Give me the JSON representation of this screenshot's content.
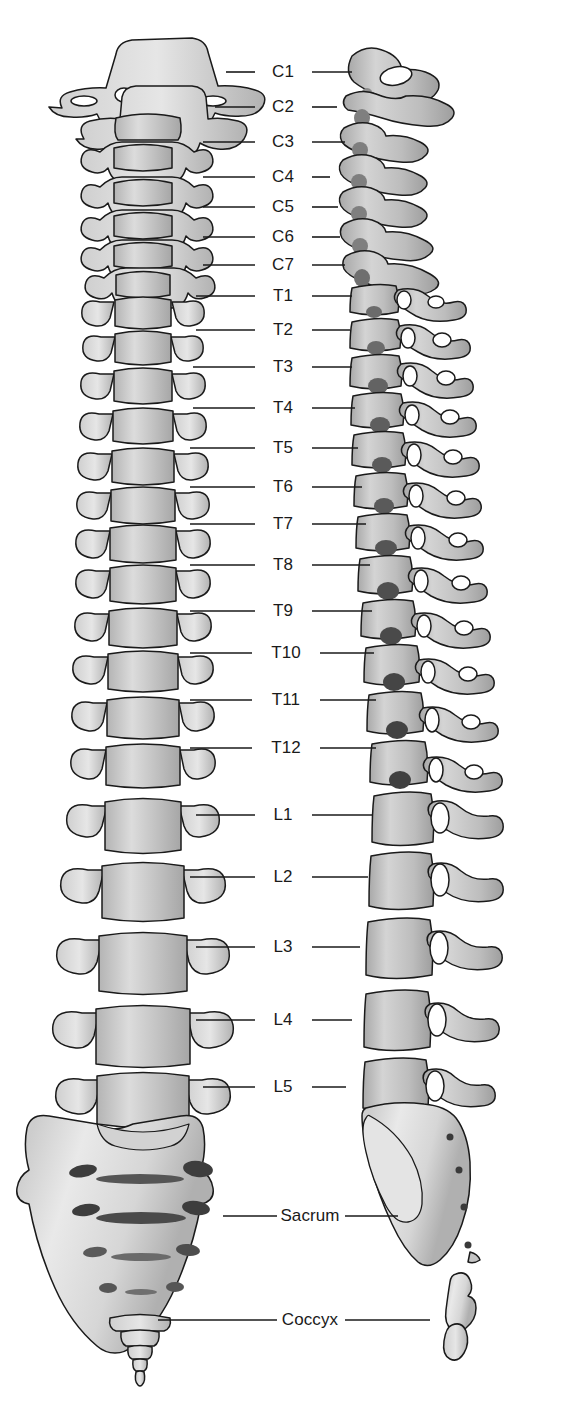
{
  "figure": {
    "views": [
      {
        "name": "anterior-view",
        "label": "Anterior view",
        "side": "left"
      },
      {
        "name": "lateral-view",
        "label": "Lateral view",
        "side": "right"
      }
    ],
    "colors": {
      "bone_light": "#e8e8e8",
      "bone_mid": "#c9c9c9",
      "bone_dark": "#a8a8a8",
      "outline": "#1a1a1a",
      "label_text": "#1a1a1a",
      "leader_line": "#1a1a1a",
      "background": "#ffffff"
    },
    "labels": [
      {
        "id": "C1",
        "text": "C1",
        "region": "cervical",
        "y": 72,
        "cx": 283,
        "left_line": [
          226,
          255
        ],
        "right_line": [
          312,
          352
        ]
      },
      {
        "id": "C2",
        "text": "C2",
        "region": "cervical",
        "y": 107,
        "cx": 283,
        "left_line": [
          215,
          255
        ],
        "right_line": [
          312,
          337
        ]
      },
      {
        "id": "C3",
        "text": "C3",
        "region": "cervical",
        "y": 142,
        "cx": 283,
        "left_line": [
          203,
          255
        ],
        "right_line": [
          312,
          345
        ]
      },
      {
        "id": "C4",
        "text": "C4",
        "region": "cervical",
        "y": 177,
        "cx": 283,
        "left_line": [
          203,
          255
        ],
        "right_line": [
          312,
          330
        ]
      },
      {
        "id": "C5",
        "text": "C5",
        "region": "cervical",
        "y": 207,
        "cx": 283,
        "left_line": [
          203,
          255
        ],
        "right_line": [
          312,
          338
        ]
      },
      {
        "id": "C6",
        "text": "C6",
        "region": "cervical",
        "y": 237,
        "cx": 283,
        "left_line": [
          203,
          255
        ],
        "right_line": [
          312,
          340
        ]
      },
      {
        "id": "C7",
        "text": "C7",
        "region": "cervical",
        "y": 265,
        "cx": 283,
        "left_line": [
          203,
          255
        ],
        "right_line": [
          312,
          345
        ]
      },
      {
        "id": "T1",
        "text": "T1",
        "region": "thoracic",
        "y": 296,
        "cx": 283,
        "left_line": [
          196,
          255
        ],
        "right_line": [
          312,
          352
        ]
      },
      {
        "id": "T2",
        "text": "T2",
        "region": "thoracic",
        "y": 330,
        "cx": 283,
        "left_line": [
          196,
          255
        ],
        "right_line": [
          312,
          350
        ]
      },
      {
        "id": "T3",
        "text": "T3",
        "region": "thoracic",
        "y": 367,
        "cx": 283,
        "left_line": [
          193,
          255
        ],
        "right_line": [
          312,
          352
        ]
      },
      {
        "id": "T4",
        "text": "T4",
        "region": "thoracic",
        "y": 408,
        "cx": 283,
        "left_line": [
          193,
          255
        ],
        "right_line": [
          312,
          355
        ]
      },
      {
        "id": "T5",
        "text": "T5",
        "region": "thoracic",
        "y": 448,
        "cx": 283,
        "left_line": [
          190,
          255
        ],
        "right_line": [
          312,
          358
        ]
      },
      {
        "id": "T6",
        "text": "T6",
        "region": "thoracic",
        "y": 487,
        "cx": 283,
        "left_line": [
          190,
          255
        ],
        "right_line": [
          312,
          362
        ]
      },
      {
        "id": "T7",
        "text": "T7",
        "region": "thoracic",
        "y": 524,
        "cx": 283,
        "left_line": [
          190,
          255
        ],
        "right_line": [
          312,
          366
        ]
      },
      {
        "id": "T8",
        "text": "T8",
        "region": "thoracic",
        "y": 565,
        "cx": 283,
        "left_line": [
          190,
          255
        ],
        "right_line": [
          312,
          370
        ]
      },
      {
        "id": "T9",
        "text": "T9",
        "region": "thoracic",
        "y": 611,
        "cx": 283,
        "left_line": [
          190,
          255
        ],
        "right_line": [
          312,
          372
        ]
      },
      {
        "id": "T10",
        "text": "T10",
        "region": "thoracic",
        "y": 653,
        "cx": 286,
        "left_line": [
          190,
          252
        ],
        "right_line": [
          320,
          374
        ]
      },
      {
        "id": "T11",
        "text": "T11",
        "region": "thoracic",
        "y": 700,
        "cx": 286,
        "left_line": [
          190,
          252
        ],
        "right_line": [
          320,
          376
        ]
      },
      {
        "id": "T12",
        "text": "T12",
        "region": "thoracic",
        "y": 748,
        "cx": 286,
        "left_line": [
          190,
          252
        ],
        "right_line": [
          320,
          376
        ]
      },
      {
        "id": "L1",
        "text": "L1",
        "region": "lumbar",
        "y": 815,
        "cx": 283,
        "left_line": [
          196,
          255
        ],
        "right_line": [
          312,
          372
        ]
      },
      {
        "id": "L2",
        "text": "L2",
        "region": "lumbar",
        "y": 877,
        "cx": 283,
        "left_line": [
          190,
          255
        ],
        "right_line": [
          312,
          368
        ]
      },
      {
        "id": "L3",
        "text": "L3",
        "region": "lumbar",
        "y": 947,
        "cx": 283,
        "left_line": [
          196,
          255
        ],
        "right_line": [
          312,
          360
        ]
      },
      {
        "id": "L4",
        "text": "L4",
        "region": "lumbar",
        "y": 1020,
        "cx": 283,
        "left_line": [
          196,
          255
        ],
        "right_line": [
          312,
          352
        ]
      },
      {
        "id": "L5",
        "text": "L5",
        "region": "lumbar",
        "y": 1087,
        "cx": 283,
        "left_line": [
          203,
          255
        ],
        "right_line": [
          312,
          346
        ]
      },
      {
        "id": "Sacrum",
        "text": "Sacrum",
        "region": "sacral",
        "y": 1216,
        "cx": 310,
        "left_line": [
          223,
          277
        ],
        "right_line": [
          345,
          398
        ]
      },
      {
        "id": "Coccyx",
        "text": "Coccyx",
        "region": "coccygeal",
        "y": 1320,
        "cx": 310,
        "left_line": [
          158,
          277
        ],
        "right_line": [
          345,
          430
        ]
      }
    ]
  }
}
